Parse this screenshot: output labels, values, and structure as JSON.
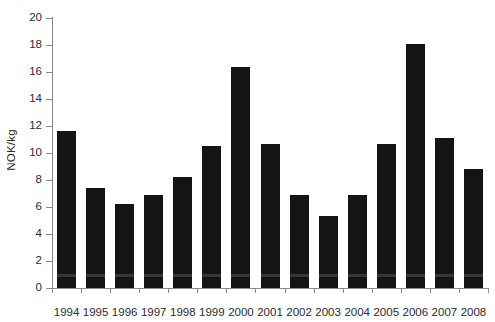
{
  "chart_data": {
    "type": "bar",
    "title": "",
    "xlabel": "",
    "ylabel": "NOK/kg",
    "categories": [
      "1994",
      "1995",
      "1996",
      "1997",
      "1998",
      "1999",
      "2000",
      "2001",
      "2002",
      "2003",
      "2004",
      "2005",
      "2006",
      "2007",
      "2008"
    ],
    "values": [
      11.6,
      7.4,
      6.2,
      6.9,
      8.2,
      10.5,
      16.4,
      10.7,
      6.9,
      5.3,
      6.9,
      10.7,
      18.1,
      11.1,
      8.8
    ],
    "ylim": [
      0,
      20
    ],
    "yticks": [
      0,
      2,
      4,
      6,
      8,
      10,
      12,
      14,
      16,
      18,
      20
    ],
    "ytick_labels": [
      "0",
      "2",
      "4",
      "6",
      "8",
      "10",
      "12",
      "14",
      "16",
      "18",
      "20"
    ],
    "grid": false,
    "legend": null,
    "bar_color": "#141414",
    "axis_color": "#8a8a8a",
    "text_color": "#2b2b2b"
  }
}
